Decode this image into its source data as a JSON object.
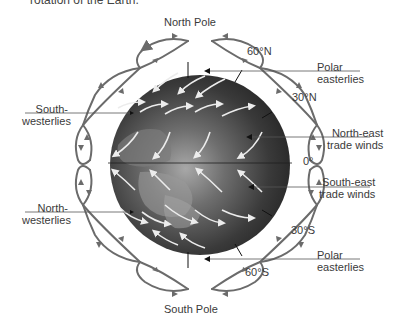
{
  "caption": "rotation of the Earth.",
  "poles": {
    "north": "North Pole",
    "south": "South Pole"
  },
  "latitudes": {
    "n60": "60°N",
    "n30": "30°N",
    "equator": "0°",
    "s30": "30°S",
    "s60": "60°S"
  },
  "winds": {
    "polar_easterlies_north": [
      "Polar",
      "easterlies"
    ],
    "south_westerlies": [
      "South-",
      "westerlies"
    ],
    "north_east_trade": [
      "North-east",
      "trade winds"
    ],
    "south_east_trade": [
      "South-east",
      "trade winds"
    ],
    "north_westerlies": [
      "North-",
      "westerlies"
    ],
    "polar_easterlies_south": [
      "Polar",
      "easterlies"
    ]
  },
  "colors": {
    "cell_arrows": "#6b6b6b",
    "globe_dark": "#2e2e2e",
    "globe_light": "#8a8a8a",
    "wind_arrows": "#e8e8e8",
    "label_lines": "#555555"
  }
}
